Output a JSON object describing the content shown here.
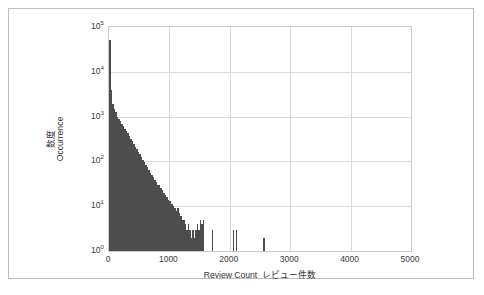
{
  "chart_data": {
    "type": "bar",
    "title": "",
    "subtitle": "",
    "xlabel_en": "Review Count",
    "xlabel_jp": "レビュー件数",
    "ylabel_en": "Occurrence",
    "ylabel_jp": "数度",
    "xlim": [
      0,
      5000
    ],
    "ylim": [
      1,
      100000
    ],
    "yscale": "log",
    "xscale": "linear",
    "grid": true,
    "legend": null,
    "bar_color": "#4d4d4d",
    "grid_color": "#d9d9d9",
    "axis_color": "#c9c9c9",
    "bin_width": 25,
    "xticks": [
      {
        "value": 0,
        "label": "0"
      },
      {
        "value": 1000,
        "label": "1000"
      },
      {
        "value": 2000,
        "label": "2000"
      },
      {
        "value": 3000,
        "label": "3000"
      },
      {
        "value": 4000,
        "label": "4000"
      },
      {
        "value": 5000,
        "label": "5000"
      }
    ],
    "yticks": [
      {
        "value": 1,
        "mantissa": "10",
        "exponent": "0"
      },
      {
        "value": 10,
        "mantissa": "10",
        "exponent": "1"
      },
      {
        "value": 100,
        "mantissa": "10",
        "exponent": "2"
      },
      {
        "value": 1000,
        "mantissa": "10",
        "exponent": "3"
      },
      {
        "value": 10000,
        "mantissa": "10",
        "exponent": "4"
      },
      {
        "value": 100000,
        "mantissa": "10",
        "exponent": "5"
      }
    ],
    "x": [
      0,
      25,
      50,
      75,
      100,
      125,
      150,
      175,
      200,
      225,
      250,
      275,
      300,
      325,
      350,
      375,
      400,
      425,
      450,
      475,
      500,
      525,
      550,
      575,
      600,
      625,
      650,
      675,
      700,
      725,
      750,
      775,
      800,
      825,
      850,
      875,
      900,
      925,
      950,
      975,
      1000,
      1025,
      1050,
      1075,
      1100,
      1125,
      1150,
      1175,
      1200,
      1225,
      1250,
      1275,
      1300,
      1325,
      1350,
      1375,
      1400,
      1425,
      1450,
      1475,
      1500,
      1525,
      1550,
      1700,
      2050,
      2100,
      2550
    ],
    "values": [
      52000,
      4000,
      1900,
      1500,
      1250,
      1000,
      900,
      780,
      700,
      620,
      540,
      470,
      420,
      370,
      320,
      280,
      250,
      215,
      190,
      165,
      145,
      125,
      110,
      95,
      84,
      74,
      65,
      56,
      50,
      44,
      38,
      34,
      30,
      30,
      26,
      23,
      20,
      18,
      16,
      14,
      13,
      11,
      10,
      9,
      8,
      9,
      7,
      6,
      5,
      5,
      4,
      3,
      4,
      3,
      2,
      3,
      2,
      3,
      4,
      3,
      5,
      4,
      5,
      3,
      3,
      3,
      2
    ]
  }
}
